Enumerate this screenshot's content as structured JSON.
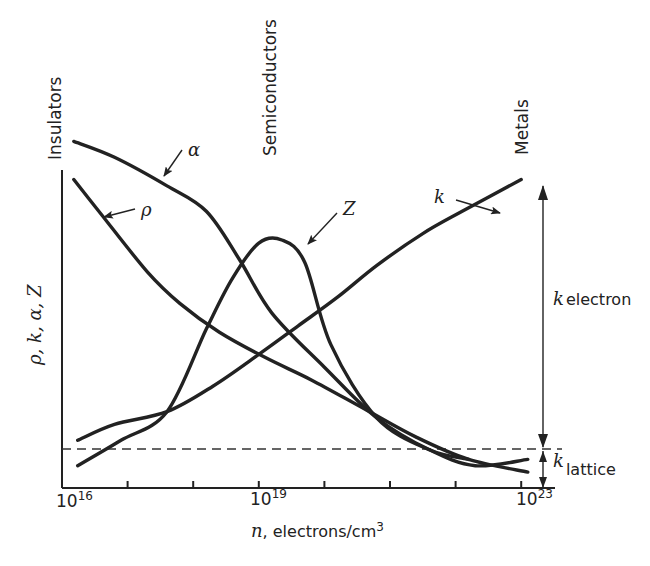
{
  "chart_data": {
    "type": "line",
    "title": "",
    "xlabel": "n, electrons/cm3",
    "ylabel": "ρ, k, α, Z",
    "x_scale": "log10",
    "xlim": [
      16,
      23
    ],
    "ylim": [
      0,
      1
    ],
    "y_units": "relative (no numeric ticks)",
    "x_ticks": [
      16,
      17,
      18,
      19,
      20,
      21,
      22,
      23
    ],
    "x_tick_labels": [
      {
        "at": 16,
        "base": "10",
        "exp": "16"
      },
      {
        "at": 19,
        "base": "10",
        "exp": "19"
      },
      {
        "at": 23,
        "base": "10",
        "exp": "23"
      }
    ],
    "grid": false,
    "legend": "none (curves labeled directly with arrows)",
    "regions": [
      {
        "label": "Insulators",
        "at_log_n": 16
      },
      {
        "label": "Semiconductors",
        "at_log_n": 19.2
      },
      {
        "label": "Metals",
        "at_log_n": 23
      }
    ],
    "series": [
      {
        "name": "α",
        "label": "α",
        "description": "Seebeck coefficient",
        "x": [
          16.18,
          16.8,
          17.6,
          18.2,
          18.7,
          19.2,
          20.0,
          20.8,
          21.6,
          22.3,
          23.1
        ],
        "y": [
          1.09,
          1.04,
          0.95,
          0.87,
          0.72,
          0.55,
          0.38,
          0.22,
          0.12,
          0.07,
          0.09
        ]
      },
      {
        "name": "ρ",
        "label": "ρ",
        "description": "electrical resistivity",
        "x": [
          16.18,
          16.6,
          17.3,
          17.8,
          18.4,
          19.1,
          19.8,
          20.6,
          21.4,
          22.2,
          23.1
        ],
        "y": [
          0.97,
          0.86,
          0.68,
          0.58,
          0.49,
          0.41,
          0.34,
          0.25,
          0.16,
          0.09,
          0.05
        ]
      },
      {
        "name": "Z",
        "label": "Z",
        "description": "thermoelectric figure of merit",
        "x": [
          16.24,
          16.9,
          17.6,
          18.2,
          18.6,
          19.0,
          19.35,
          19.7,
          20.1,
          20.8,
          21.6,
          22.2
        ],
        "y": [
          0.07,
          0.15,
          0.24,
          0.5,
          0.66,
          0.77,
          0.78,
          0.71,
          0.45,
          0.22,
          0.12,
          0.09
        ]
      },
      {
        "name": "k",
        "label": "k",
        "description": "thermal conductivity",
        "x": [
          16.24,
          16.8,
          17.6,
          18.3,
          19.0,
          19.6,
          20.2,
          20.8,
          21.5,
          22.1,
          23.0
        ],
        "y": [
          0.15,
          0.2,
          0.24,
          0.32,
          0.42,
          0.51,
          0.6,
          0.7,
          0.8,
          0.87,
          0.97
        ]
      }
    ],
    "reference_lines": [
      {
        "type": "horizontal_dashed",
        "y": 0.13,
        "meaning": "k_lattice level"
      }
    ],
    "annotations": [
      {
        "text": "k_electron",
        "main": "k",
        "subscript": "electron",
        "spans": [
          0.13,
          0.97
        ]
      },
      {
        "text": "k_lattice",
        "main": "k",
        "subscript": "lattice",
        "spans": [
          0,
          0.13
        ]
      }
    ]
  },
  "labels": {
    "insulators": "Insulators",
    "semiconductors": "Semiconductors",
    "metals": "Metals",
    "ylabel": "ρ, k, α, Z",
    "xlabel_var": "n",
    "xlabel_rest": ", electrons/cm",
    "xlabel_exp": "3",
    "alpha": "α",
    "rho": "ρ",
    "Z": "Z",
    "k": "k",
    "k_electron_main": "k",
    "k_electron_sub": "electron",
    "k_lattice_main": "k",
    "k_lattice_sub": "lattice",
    "tick_base": "10",
    "tick16": "16",
    "tick19": "19",
    "tick23": "23"
  }
}
